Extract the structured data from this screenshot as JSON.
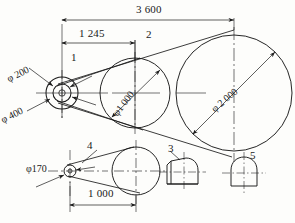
{
  "drawing": {
    "title": "belt-drive-assembly-drawing",
    "line_color": "#1a1a1a",
    "background": "#fdfdfb",
    "dimensions": {
      "overall_span": "3 600",
      "first_span": "1 245",
      "lower_span": "1 000"
    },
    "diameters": {
      "pulley_small_inner": "φ 200",
      "pulley_small_outer": "φ 400",
      "pulley_mid": "φ1 000",
      "pulley_large": "φ 2 000",
      "pulley_lower": "φ170"
    },
    "part_numbers": {
      "item1": "1",
      "item2": "2",
      "item3": "3",
      "item4": "4",
      "item5": "5"
    }
  }
}
